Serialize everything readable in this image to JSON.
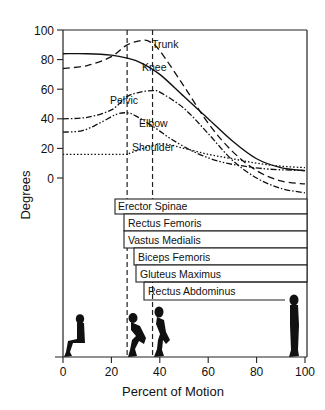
{
  "chart_data": {
    "type": "line",
    "title": "",
    "xlabel": "Percent of Motion",
    "ylabel": "Degrees",
    "xlim": [
      0,
      100
    ],
    "ylim": [
      -12,
      100
    ],
    "x_ticks": [
      0,
      20,
      40,
      60,
      80,
      100
    ],
    "y_ticks": [
      0,
      20,
      40,
      60,
      80,
      100
    ],
    "grid": false,
    "legend": "inline labels on curves",
    "phase_markers": [
      {
        "x": 26.5,
        "style": "dashed"
      },
      {
        "x": 37,
        "style": "dashed"
      }
    ],
    "series": [
      {
        "name": "Trunk",
        "line_style": "long-dash",
        "label_at": {
          "x": 38,
          "y": 94
        },
        "points": [
          [
            0,
            74
          ],
          [
            10,
            76
          ],
          [
            20,
            82
          ],
          [
            26.5,
            90
          ],
          [
            33,
            93
          ],
          [
            36,
            92
          ],
          [
            40,
            86
          ],
          [
            50,
            62
          ],
          [
            60,
            37
          ],
          [
            70,
            18
          ],
          [
            80,
            5
          ],
          [
            90,
            -2
          ],
          [
            100,
            -4
          ]
        ]
      },
      {
        "name": "Knee",
        "line_style": "solid",
        "label_at": {
          "x": 33,
          "y": 78
        },
        "points": [
          [
            0,
            84
          ],
          [
            10,
            84
          ],
          [
            20,
            83
          ],
          [
            26.5,
            81
          ],
          [
            32,
            78
          ],
          [
            40,
            70
          ],
          [
            50,
            55
          ],
          [
            60,
            40
          ],
          [
            70,
            25
          ],
          [
            80,
            13
          ],
          [
            90,
            7
          ],
          [
            100,
            5
          ]
        ]
      },
      {
        "name": "Pelvic",
        "line_style": "dash-dot",
        "label_at": {
          "x": 20,
          "y": 48
        },
        "points": [
          [
            0,
            40
          ],
          [
            10,
            41
          ],
          [
            20,
            46
          ],
          [
            26.5,
            55
          ],
          [
            32,
            58
          ],
          [
            37,
            59
          ],
          [
            40,
            58
          ],
          [
            50,
            47
          ],
          [
            60,
            30
          ],
          [
            70,
            12
          ],
          [
            80,
            0
          ],
          [
            90,
            -7
          ],
          [
            100,
            -10
          ]
        ]
      },
      {
        "name": "Elbow",
        "line_style": "dash-dot-dot",
        "label_at": {
          "x": 37,
          "y": 36
        },
        "points": [
          [
            0,
            31
          ],
          [
            8,
            32
          ],
          [
            15,
            37
          ],
          [
            22,
            43
          ],
          [
            26.5,
            44
          ],
          [
            30,
            42
          ],
          [
            38,
            34
          ],
          [
            45,
            26
          ],
          [
            55,
            17
          ],
          [
            65,
            11
          ],
          [
            75,
            8
          ],
          [
            85,
            6
          ],
          [
            100,
            5
          ]
        ]
      },
      {
        "name": "Shoulder",
        "line_style": "dotted",
        "label_at": {
          "x": 28,
          "y": 18
        },
        "points": [
          [
            0,
            16
          ],
          [
            10,
            16
          ],
          [
            20,
            16
          ],
          [
            26.5,
            16
          ],
          [
            28,
            17
          ],
          [
            40,
            23
          ],
          [
            50,
            20
          ],
          [
            60,
            16
          ],
          [
            70,
            13
          ],
          [
            80,
            10
          ],
          [
            90,
            8
          ],
          [
            100,
            7
          ]
        ]
      }
    ],
    "muscle_activity": [
      {
        "name": "Erector Spinae",
        "start": 21.5,
        "end": 100
      },
      {
        "name": "Rectus Femoris",
        "start": 25,
        "end": 100
      },
      {
        "name": "Vastus Medialis",
        "start": 25,
        "end": 100
      },
      {
        "name": "Biceps Femoris",
        "start": 29,
        "end": 100
      },
      {
        "name": "Gluteus Maximus",
        "start": 30,
        "end": 100
      },
      {
        "name": "Rectus Abdominus",
        "start": 33,
        "end": 95
      }
    ],
    "postures": [
      {
        "name": "sitting",
        "x": 4
      },
      {
        "name": "forward-lean squat",
        "x": 29
      },
      {
        "name": "rising squat",
        "x": 40
      },
      {
        "name": "standing",
        "x": 96
      }
    ]
  },
  "axes": {
    "xlabel": "Percent of Motion",
    "ylabel": "Degrees",
    "x_tick_labels": [
      "0",
      "20",
      "40",
      "60",
      "80",
      "100"
    ],
    "y_tick_labels": [
      "0",
      "20",
      "40",
      "60",
      "80",
      "100"
    ]
  },
  "labels": {
    "trunk": "Trunk",
    "knee": "Knee",
    "pelvic": "Pelvic",
    "elbow": "Elbow",
    "shoulder": "Shoulder"
  },
  "muscles": [
    "Erector Spinae",
    "Rectus Femoris",
    "Vastus Medialis",
    "Biceps Femoris",
    "Gluteus Maximus",
    "Rectus Abdominus"
  ]
}
